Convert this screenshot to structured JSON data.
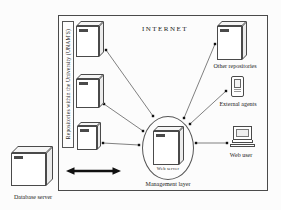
{
  "colors": {
    "line": "#4a4a4a",
    "text": "#1b1b1b",
    "background": "#fcfcfc"
  },
  "diagram": {
    "internet_label": "INTERNET",
    "university_repositories_label": "Repositories within the University (UNAM'S)",
    "web_server_label": "Web server",
    "management_layer_label": "Management layer",
    "other_repositories_label": "Other repositories",
    "external_agents_label": "External agents",
    "web_user_label": "Web user",
    "database_server_label": "Database server"
  }
}
